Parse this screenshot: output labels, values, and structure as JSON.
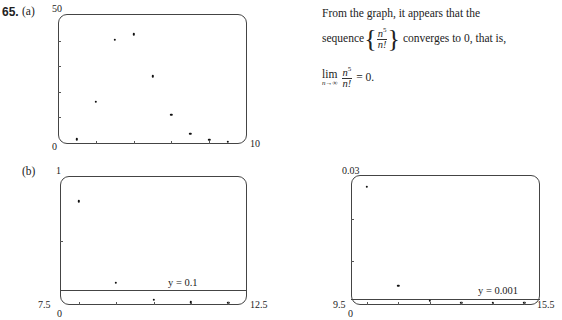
{
  "problem": {
    "number": "65.",
    "part_a": "(a)",
    "part_b": "(b)"
  },
  "explanation": {
    "line1": "From the graph, it appears that the",
    "line2_prefix": "sequence",
    "line2_suffix": "converges to 0, that is,",
    "frac_num": "n",
    "frac_num_exp": "5",
    "frac_den": "n!",
    "lim": "lim",
    "lim_sub": "n→∞",
    "result": "= 0."
  },
  "chart_data": [
    {
      "id": "a",
      "type": "scatter",
      "title": "(a)",
      "xlim": [
        0,
        10
      ],
      "ylim": [
        0,
        50
      ],
      "x_tick_labels": {
        "left": "0",
        "right": "10"
      },
      "y_tick_labels": {
        "top": "50"
      },
      "x": [
        1,
        2,
        3,
        4,
        5,
        6,
        7,
        8,
        9
      ],
      "values": [
        1,
        16,
        40.5,
        42.67,
        26.04,
        10.8,
        3.33,
        0.81,
        0.16
      ],
      "series_label": "n^5/n!",
      "grid": false
    },
    {
      "id": "b1",
      "type": "scatter",
      "title": "(b)",
      "xlim": [
        7.5,
        12.5
      ],
      "ylim": [
        0,
        1
      ],
      "x_tick_labels": {
        "left": "7.5",
        "right": "12.5",
        "origin": "0"
      },
      "y_tick_labels": {
        "top": "1"
      },
      "x": [
        8,
        9,
        10,
        11,
        12
      ],
      "values": [
        0.813,
        0.164,
        0.0276,
        0.00403,
        0.00052
      ],
      "reference_line": {
        "y": 0.1,
        "label": "y = 0.1"
      },
      "grid": false
    },
    {
      "id": "b2",
      "type": "scatter",
      "title": "",
      "xlim": [
        9.5,
        15.5
      ],
      "ylim": [
        0,
        0.03
      ],
      "x_tick_labels": {
        "left": "9.5",
        "right": "15.5",
        "origin": "0"
      },
      "y_tick_labels": {
        "top": "0.03"
      },
      "x": [
        10,
        11,
        12,
        13,
        14,
        15
      ],
      "values": [
        0.0276,
        0.00403,
        0.00052,
        6e-05,
        6e-06,
        6e-07
      ],
      "reference_line": {
        "y": 0.001,
        "label": "y = 0.001"
      },
      "grid": false
    }
  ]
}
